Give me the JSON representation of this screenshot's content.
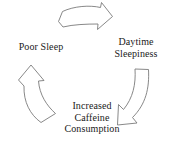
{
  "diagram": {
    "type": "cycle",
    "direction": "clockwise",
    "background_color": "#ffffff",
    "stroke_color": "#7a7a7a",
    "text_color": "#1a1a1a",
    "nodes": [
      {
        "id": "poor-sleep",
        "label": "Poor Sleep"
      },
      {
        "id": "daytime-sleepiness",
        "label": "Daytime\nSleepiness"
      },
      {
        "id": "increased-caffeine",
        "label": "Increased\nCaffeine\nConsumption"
      }
    ],
    "arrows": [
      {
        "id": "arrow-top",
        "from": "poor-sleep",
        "to": "daytime-sleepiness",
        "icon": "block-arrow-right-icon"
      },
      {
        "id": "arrow-right",
        "from": "daytime-sleepiness",
        "to": "increased-caffeine",
        "icon": "curved-block-arrow-down-left-icon"
      },
      {
        "id": "arrow-left",
        "from": "increased-caffeine",
        "to": "poor-sleep",
        "icon": "curved-block-arrow-up-right-icon"
      }
    ]
  }
}
